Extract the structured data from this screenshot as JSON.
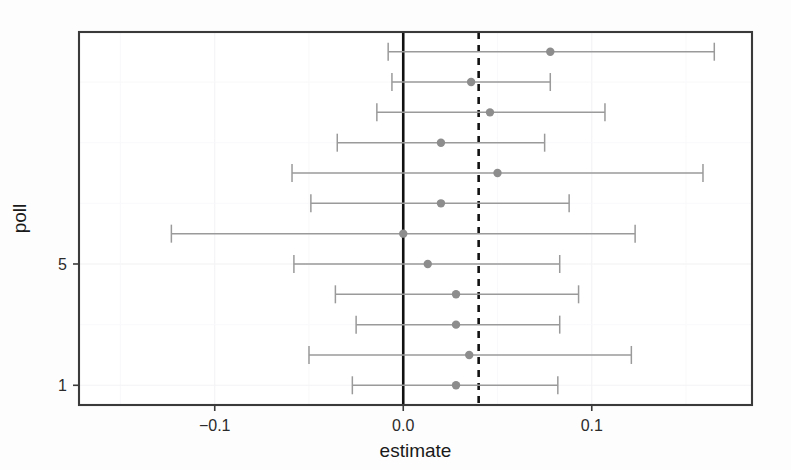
{
  "chart_data": {
    "type": "scatter",
    "subtype": "forest-plot-error-bars",
    "title": "",
    "xlabel": "estimate",
    "ylabel": "poll",
    "xlim": [
      -0.172,
      0.185
    ],
    "ylim": [
      0.35,
      12.65
    ],
    "x_ticks": [
      -0.1,
      0.0,
      0.1
    ],
    "x_tick_labels": [
      "-0.1",
      "0.0",
      "0.1"
    ],
    "y_ticks": [
      1,
      5
    ],
    "y_tick_labels": [
      "1",
      "5"
    ],
    "grid": true,
    "legend": "none",
    "orientation": "horizontal",
    "reference_lines": [
      {
        "name": "zero-line",
        "x": 0.0,
        "style": "solid",
        "color": "#111111"
      },
      {
        "name": "pooled-estimate-line",
        "x": 0.04,
        "style": "dashed",
        "color": "#121212"
      }
    ],
    "point_color": "#8d8d8d",
    "errorbar_color": "#9a9a9a",
    "categories": [
      12,
      11,
      10,
      9,
      8,
      7,
      6,
      5,
      4,
      3,
      2,
      1
    ],
    "rows": [
      {
        "poll": 12,
        "estimate": 0.078,
        "low": -0.008,
        "high": 0.165
      },
      {
        "poll": 11,
        "estimate": 0.036,
        "low": -0.006,
        "high": 0.078
      },
      {
        "poll": 10,
        "estimate": 0.046,
        "low": -0.014,
        "high": 0.107
      },
      {
        "poll": 9,
        "estimate": 0.02,
        "low": -0.035,
        "high": 0.075
      },
      {
        "poll": 8,
        "estimate": 0.05,
        "low": -0.059,
        "high": 0.159
      },
      {
        "poll": 7,
        "estimate": 0.02,
        "low": -0.049,
        "high": 0.088
      },
      {
        "poll": 6,
        "estimate": 0.0,
        "low": -0.123,
        "high": 0.123
      },
      {
        "poll": 5,
        "estimate": 0.013,
        "low": -0.058,
        "high": 0.083
      },
      {
        "poll": 4,
        "estimate": 0.028,
        "low": -0.036,
        "high": 0.093
      },
      {
        "poll": 3,
        "estimate": 0.028,
        "low": -0.025,
        "high": 0.083
      },
      {
        "poll": 2,
        "estimate": 0.035,
        "low": -0.05,
        "high": 0.121
      },
      {
        "poll": 1,
        "estimate": 0.028,
        "low": -0.027,
        "high": 0.082
      }
    ]
  },
  "axes": {
    "x_title": "estimate",
    "y_title": "poll"
  }
}
